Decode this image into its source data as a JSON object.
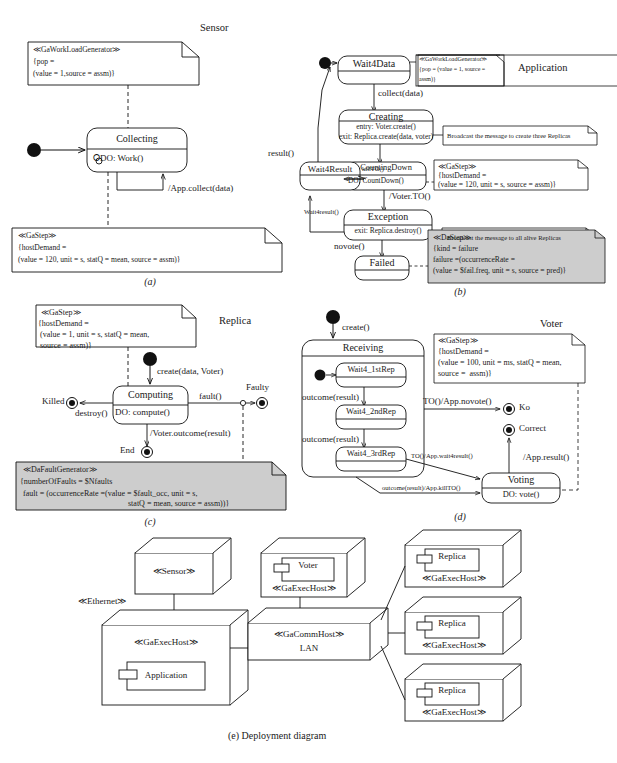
{
  "figure": {
    "caption_e": "(e) Deployment diagram",
    "panels": [
      "(a)",
      "(b)",
      "(c)",
      "(d)"
    ]
  },
  "panel_a": {
    "title": "Sensor",
    "caption": "(a)",
    "note_top": {
      "stereotype": "≪GaWorkLoadGenerator≫",
      "line1": "{pop =",
      "line2": "(value = 1,source = assm)}"
    },
    "state": {
      "name": "Collecting",
      "activity": "⭘DO: Work()"
    },
    "note_bottom": {
      "stereotype": "≪GaStep≫",
      "line1": "{hostDemand =",
      "line2": "(value = 120, unit = s, statQ = mean, source = assm)}"
    },
    "self_transition": "/App.collect(data)"
  },
  "panel_b": {
    "title": "Application",
    "caption": "(b)",
    "states": {
      "wait4data": "Wait4Data",
      "creating": "Creating",
      "creating_entry": "entry: Voter.create()",
      "creating_exit": "exit: Replica.create(data, voter)",
      "wait4result": "Wait4Result",
      "countingdown": "CountingDown",
      "countingdown_do": "DO: CountDown()",
      "exception": "Exception",
      "exception_exit": "exit: Replica.destroy()",
      "failed": "Failed"
    },
    "transitions": {
      "collect": "collect(data)",
      "result": "result()",
      "killto": "killTO()",
      "voter_to": "/Voter.TO()",
      "wait4result": "Wait4result()",
      "novote": "novote()"
    },
    "note_gawlg": {
      "stereotype": "≪GaWorkLoadGenerator≫",
      "line1": "{pop = (value = 1, source =",
      "line2": "assm)}"
    },
    "note_broadcast1": "Broadcast the message to create three Replicas",
    "note_gastep": {
      "stereotype": "≪GaStep≫",
      "line1": "{hostDemand =",
      "line2": "(value = 120, unit = s, source = assm)}"
    },
    "note_broadcast2": "Broadcast the message to all alive Replicas",
    "note_dastep": {
      "stereotype": "≪DaStep≫",
      "line1": "{kind = failure",
      "line2": "failure =(occurrenceRate =",
      "line3": "(value = $fail.freq, unit = s, source = pred)}"
    }
  },
  "panel_c": {
    "title": "Replica",
    "caption": "(c)",
    "note_gastep": {
      "stereotype": "≪GaStep≫",
      "line1": "{hostDemand =",
      "line2": "(value = 1, unit = s, statQ = mean,",
      "line3": "source = assm)}"
    },
    "state": {
      "name": "Computing",
      "activity": "DO: compute()"
    },
    "finals": {
      "killed": "Killed",
      "faulty": "Faulty",
      "end": "End"
    },
    "transitions": {
      "create": "create(data, Voter)",
      "destroy": "destroy()",
      "fault": "fault()",
      "outcome": "/Voter.outcome(result)"
    },
    "note_fault": {
      "stereotype": "≪DaFaultGenerator≫",
      "line1": "{numberOfFaults = $Nfaults",
      "line2": "fault = (occurrenceRate =(value = $fault_occ, unit = s,",
      "line3": "statQ = mean, source = assm))}"
    }
  },
  "panel_d": {
    "title": "Voter",
    "caption": "(d)",
    "states": {
      "receiving": "Receiving",
      "w1": "Wait4_1stRep",
      "w2": "Wait4_2ndRep",
      "w3": "Wait4_3rdRep",
      "voting": "Voting",
      "voting_do": "DO: vote()"
    },
    "finals": {
      "ko": "Ko",
      "correct": "Correct"
    },
    "transitions": {
      "create": "create()",
      "outcome1": "outcome(result)",
      "outcome2": "outcome(result)",
      "novote": "TO()/App.novote()",
      "wait4result": "TO()/App.wait4result()",
      "killto": "outcome(result)/App.killTO()",
      "result": "/App.result()"
    },
    "note_gastep": {
      "stereotype": "≪GaStep≫",
      "line1": "{hostDemand =",
      "line2": "(value = 100, unit = ms, statQ = mean,",
      "line3": "source =  assm)}"
    }
  },
  "panel_e": {
    "nodes": {
      "sensor": "≪Sensor≫",
      "ethernet": "≪Ethernet≫",
      "gaexechost_app": "≪GaExecHost≫",
      "application": "Application",
      "voter": "Voter",
      "gaexechost_voter": "≪GaExecHost≫",
      "gacommhost": "≪GaCommHost≫",
      "lan": "LAN",
      "replica": "Replica",
      "gaexechost_replica": "≪GaExecHost≫"
    }
  }
}
